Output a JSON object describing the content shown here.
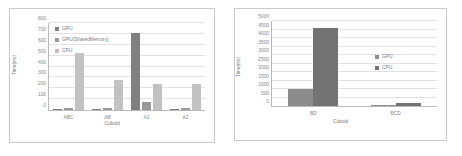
{
  "chart_data": [
    {
      "id": "left",
      "type": "bar",
      "title": "",
      "xlabel": "Cuboid",
      "ylabel": "Time(ms)",
      "ylim": [
        0,
        800
      ],
      "ytick_step": 100,
      "yticks": [
        "0",
        "100",
        "200",
        "300",
        "400",
        "500",
        "600",
        "700",
        "800"
      ],
      "grid": true,
      "legend_position": "top-left",
      "categories": [
        "ABC",
        "AB",
        "A1",
        "A2"
      ],
      "series": [
        {
          "name": "GPU",
          "color": "#808080",
          "values": [
            10,
            8,
            705,
            12
          ]
        },
        {
          "name": "GPU(SharedMemory)",
          "color": "#9a9a9a",
          "values": [
            15,
            20,
            70,
            15
          ]
        },
        {
          "name": "CPU",
          "color": "#c2c2c2",
          "values": [
            525,
            275,
            240,
            240
          ]
        }
      ]
    },
    {
      "id": "right",
      "type": "bar",
      "title": "",
      "xlabel": "Cuboid",
      "ylabel": "Time(ms)",
      "ylim": [
        0,
        5000
      ],
      "ytick_step": 500,
      "yticks": [
        "0",
        "500",
        "1000",
        "1500",
        "2000",
        "2500",
        "3000",
        "3500",
        "4000",
        "4500",
        "5000"
      ],
      "grid": true,
      "legend_position": "middle-right",
      "categories": [
        "BD",
        "BCD"
      ],
      "series": [
        {
          "name": "GPU",
          "color": "#8c8c8c",
          "values": [
            1030,
            80
          ]
        },
        {
          "name": "CPU",
          "color": "#737373",
          "values": [
            4570,
            150
          ]
        }
      ]
    }
  ]
}
